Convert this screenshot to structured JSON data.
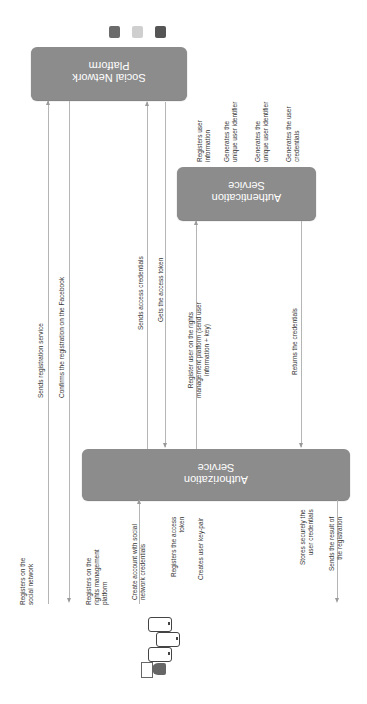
{
  "lifelines": {
    "social_network": {
      "label_line1": "Social Network",
      "label_line2": "Platform"
    },
    "authentication": {
      "label_line1": "Authentication",
      "label_line2": "Service"
    },
    "authorization": {
      "label_line1": "Authorization",
      "label_line2": "Service"
    }
  },
  "social_icons": [
    "facebook-icon",
    "instagram-icon",
    "google-plus-icon"
  ],
  "user_icons": [
    "smartphone-icon",
    "smartphone-icon",
    "smartphone-icon",
    "user-icon"
  ],
  "messages": {
    "m1": {
      "line1": "Registers on the",
      "line2": "social network"
    },
    "m2": {
      "line1": "Sends registration service"
    },
    "m3": {
      "line1": "Confirms the registration on the Facebook"
    },
    "m4": {
      "line1": "Registers on the",
      "line2": "rights management",
      "line3": "platform"
    },
    "m5": {
      "line1": "Create account with social",
      "line2": "network credentials"
    },
    "m6": {
      "line1": "Sends access credentials"
    },
    "m7": {
      "line1": "Gets the access token"
    },
    "m8": {
      "line1": "Registers the access",
      "line2": "token"
    },
    "m9": {
      "line1": "Creates user key-pair"
    },
    "m10": {
      "line1": "Register user on the rights",
      "line2": "management platform (send user",
      "line3": "information + key)"
    },
    "m11": {
      "line1": "Registers user",
      "line2": "information"
    },
    "m12": {
      "line1": "Generates the",
      "line2": "unique user identifier"
    },
    "m13": {
      "line1": "Generates the",
      "line2": "unique user identifier"
    },
    "m14": {
      "line1": "Generates the user",
      "line2": "credentials"
    },
    "m15": {
      "line1": "Returns the credentials"
    },
    "m16": {
      "line1": "Stores securely the",
      "line2": "user credentials"
    },
    "m17": {
      "line1": "Sends the result of",
      "line2": "the registration"
    }
  },
  "colors": {
    "box": "#8c8c8c",
    "line": "#b5b5b5",
    "text": "#333333",
    "box_text": "#ffffff"
  }
}
